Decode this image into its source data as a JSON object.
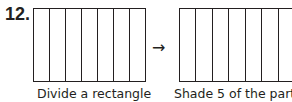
{
  "problem": {
    "number": "12.",
    "arrow": "→",
    "left": {
      "columns": 7,
      "caption": "Divide a rectangle"
    },
    "right": {
      "columns": 7,
      "caption": "Shade 5 of the parts"
    }
  }
}
